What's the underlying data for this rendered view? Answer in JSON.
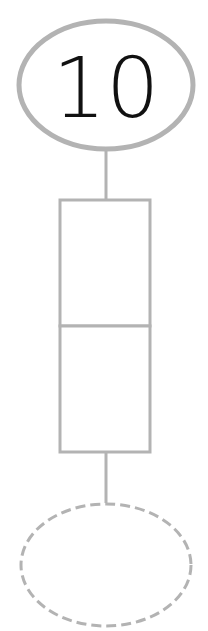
{
  "diagram": {
    "top_node": {
      "label": "10",
      "shape": "ellipse",
      "style": "solid"
    },
    "middle_node": {
      "shape": "rectangle",
      "sections": 2,
      "section_labels": [
        "",
        ""
      ]
    },
    "bottom_node": {
      "label": "",
      "shape": "ellipse",
      "style": "dashed"
    },
    "colors": {
      "stroke": "#b3b3b3",
      "text": "#111111",
      "background": "#ffffff"
    }
  }
}
